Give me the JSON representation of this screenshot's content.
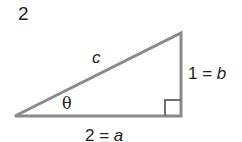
{
  "problem_number": "2",
  "triangle": {
    "hypotenuse_label": "c",
    "angle_label": "θ",
    "vertical_leg_label": "1 = b",
    "horizontal_leg_label": "2 = a",
    "stroke_color": "#8a8a8a",
    "text_color": "#222222"
  }
}
